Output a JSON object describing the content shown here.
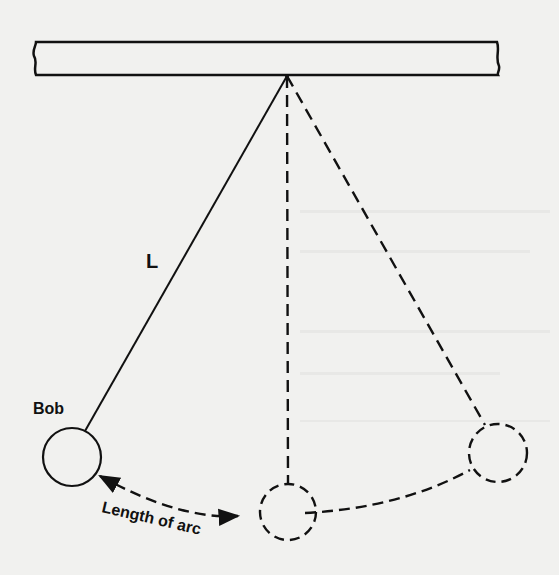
{
  "figure": {
    "type": "pendulum diagram",
    "labels": {
      "string_length": "L",
      "bob": "Bob",
      "arc": "Length of arc"
    },
    "elements": {
      "support_beam": "rigid support bar",
      "pivot": "pivot point",
      "string_solid": "pendulum string (displaced position)",
      "string_rest": "dashed string at rest position",
      "string_opposite": "dashed string at opposite extreme",
      "bob_left": "solid bob (left extreme)",
      "bob_center": "dashed bob (rest position)",
      "bob_right": "dashed bob (right extreme)",
      "arc_arrow": "double-headed dashed arc",
      "arc_right": "dashed arc path"
    },
    "colors": {
      "ink": "#111111",
      "paper": "#f1f1ef"
    }
  }
}
